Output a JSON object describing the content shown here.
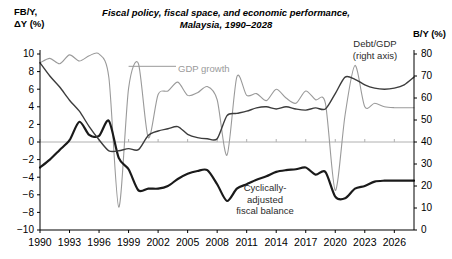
{
  "chart_data": {
    "type": "line",
    "title_line1": "Fiscal policy, fiscal space, and economic performance,",
    "title_line2": "Malaysia, 1990–2028",
    "ylabel_left": "FB/Y,\nΔY (%)",
    "ylabel_left_line1": "FB/Y,",
    "ylabel_left_line2": "ΔY (%)",
    "ylabel_right": "B/Y (%)",
    "xlabel": "",
    "grid": false,
    "legend_position": "inline-annotations",
    "x": [
      1990,
      1991,
      1992,
      1993,
      1994,
      1995,
      1996,
      1997,
      1998,
      1999,
      2000,
      2001,
      2002,
      2003,
      2004,
      2005,
      2006,
      2007,
      2008,
      2009,
      2010,
      2011,
      2012,
      2013,
      2014,
      2015,
      2016,
      2017,
      2018,
      2019,
      2020,
      2021,
      2022,
      2023,
      2024,
      2025,
      2026,
      2027,
      2028
    ],
    "xticks": [
      1990,
      1993,
      1996,
      1999,
      2002,
      2005,
      2008,
      2011,
      2014,
      2017,
      2020,
      2023,
      2026
    ],
    "xticklabels": [
      "1990",
      "1993",
      "1996",
      "1999",
      "2002",
      "2005",
      "2008",
      "2011",
      "2014",
      "2017",
      "2020",
      "2023",
      "2026"
    ],
    "xlim": [
      1990,
      2028
    ],
    "ylim_left": [
      -10,
      10
    ],
    "yticks_left": [
      10,
      8,
      6,
      4,
      2,
      0,
      -2,
      -4,
      -6,
      -8,
      -10
    ],
    "yticklabels_left": [
      "10",
      "8",
      "6",
      "4",
      "2",
      "0",
      "−2",
      "−4",
      "−6",
      "−8",
      "−10"
    ],
    "ylim_right": [
      0,
      80
    ],
    "yticks_right": [
      80,
      70,
      60,
      50,
      40,
      30,
      20,
      10,
      0
    ],
    "yticklabels_right": [
      "80",
      "70",
      "60",
      "50",
      "40",
      "30",
      "20",
      "10",
      "0"
    ],
    "zero_line_left": 0,
    "series": [
      {
        "name": "GDP growth",
        "axis": "left",
        "color": "#9a9a9a",
        "width": 1.1,
        "annotation": "GDP growth",
        "values": [
          9.0,
          9.5,
          8.9,
          9.9,
          9.2,
          9.8,
          10.0,
          7.3,
          -7.4,
          6.1,
          8.9,
          0.5,
          5.4,
          5.8,
          6.8,
          5.3,
          5.6,
          6.3,
          4.8,
          -1.5,
          7.4,
          5.3,
          5.5,
          4.7,
          6.0,
          5.0,
          4.4,
          5.8,
          4.8,
          4.4,
          -5.5,
          3.1,
          8.7,
          4.0,
          4.4,
          4.0,
          3.9,
          3.9,
          3.9
        ]
      },
      {
        "name": "Cyclically-adjusted fiscal balance",
        "axis": "left",
        "color": "#1a1a1a",
        "width": 2.2,
        "annotation": "Cyclically-\nadjusted\nfiscal balance",
        "annotation_line1": "Cyclically-",
        "annotation_line2": "adjusted",
        "annotation_line3": "fiscal balance",
        "values": [
          -2.9,
          -2.0,
          -0.9,
          0.2,
          2.3,
          0.8,
          0.7,
          2.4,
          -1.8,
          -3.1,
          -5.5,
          -5.3,
          -5.3,
          -5.0,
          -4.2,
          -3.6,
          -3.3,
          -3.2,
          -4.8,
          -6.7,
          -5.3,
          -4.8,
          -4.3,
          -3.9,
          -3.4,
          -3.2,
          -3.1,
          -2.9,
          -3.7,
          -3.4,
          -6.2,
          -6.4,
          -5.3,
          -5.0,
          -4.5,
          -4.4,
          -4.4,
          -4.4,
          -4.4
        ]
      },
      {
        "name": "Debt/GDP",
        "axis": "right",
        "color": "#3c3c3c",
        "width": 1.4,
        "annotation": "Debt/GDP\n(right axis)",
        "annotation_line1": "Debt/GDP",
        "annotation_line2": "(right axis)",
        "values": [
          76.0,
          70.0,
          65.0,
          59.0,
          54.0,
          47.0,
          41.0,
          36.0,
          36.0,
          37.0,
          36.5,
          43.0,
          45.0,
          46.0,
          47.0,
          43.5,
          42.0,
          41.5,
          41.5,
          52.0,
          53.0,
          54.0,
          55.5,
          56.0,
          55.0,
          56.0,
          55.0,
          54.5,
          55.5,
          55.0,
          62.0,
          69.5,
          68.5,
          66.0,
          64.5,
          64.0,
          64.5,
          66.0,
          69.5
        ]
      }
    ]
  },
  "annotations": {
    "gdp_growth": "GDP growth",
    "debt_gdp_line1": "Debt/GDP",
    "debt_gdp_line2": "(right axis)",
    "fb_line1": "Cyclically-",
    "fb_line2": "adjusted",
    "fb_line3": "fiscal balance"
  },
  "colors": {
    "gdp": "#9a9a9a",
    "fiscal_balance": "#1a1a1a",
    "debt": "#3c3c3c",
    "axis": "#000000",
    "zero_line": "#b0b0b0"
  }
}
